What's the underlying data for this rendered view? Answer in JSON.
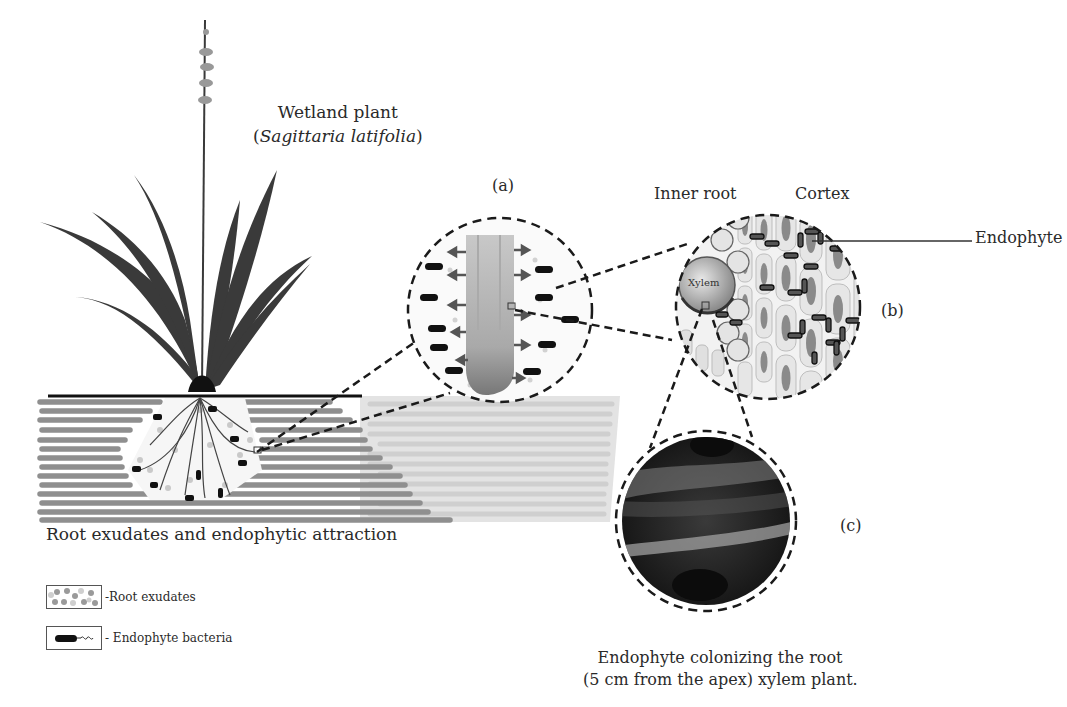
{
  "plant": {
    "title": "Wetland plant",
    "scientific_name": "Sagittaria latifolia",
    "open_paren": "(",
    "close_paren": ")"
  },
  "panels": {
    "a": {
      "label": "(a)"
    },
    "b": {
      "label": "(b)",
      "inner_root_label": "Inner root",
      "cortex_label": "Cortex",
      "endophyte_label": "Endophyte",
      "xylem_label": "Xylem"
    },
    "c": {
      "label": "(c)"
    }
  },
  "captions": {
    "left": "Root exudates and endophytic attraction",
    "right_line1": "Endophyte colonizing the root",
    "right_line2": "(5 cm from the apex) xylem plant."
  },
  "legend": [
    {
      "label": "-Root exudates",
      "symbol": "exudate-dots"
    },
    {
      "label": "- Endophyte bacteria",
      "symbol": "bacterium"
    }
  ],
  "colors": {
    "soil_dark": "#8c8c8c",
    "soil_light": "#d6d6d6",
    "plant": "#3a3a3a",
    "dash": "#1a1a1a",
    "micrograph_dark": "#1e1e1e",
    "micrograph_light": "#9a9a9a"
  }
}
